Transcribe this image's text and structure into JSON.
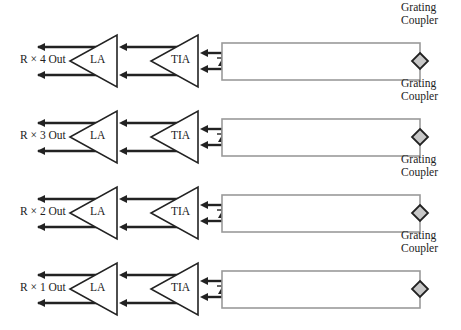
{
  "diagram": {
    "type": "optical receiver array block diagram",
    "colors": {
      "line": "#222222",
      "waveguide": "#9a9a9a",
      "coupler_fill": "#c8c8c8",
      "background": "#ffffff"
    },
    "rows": [
      {
        "output_label": "R × 4 Out",
        "la_label": "LA",
        "tia_label": "TIA",
        "coupler_label_line1": "Grating",
        "coupler_label_line2": "Coupler"
      },
      {
        "output_label": "R × 3 Out",
        "la_label": "LA",
        "tia_label": "TIA",
        "coupler_label_line1": "Grating",
        "coupler_label_line2": "Coupler"
      },
      {
        "output_label": "R × 2 Out",
        "la_label": "LA",
        "tia_label": "TIA",
        "coupler_label_line1": "Grating",
        "coupler_label_line2": "Coupler"
      },
      {
        "output_label": "R × 1 Out",
        "la_label": "LA",
        "tia_label": "TIA",
        "coupler_label_line1": "Grating",
        "coupler_label_line2": "Coupler"
      }
    ],
    "components": [
      "Grating Coupler",
      "Waveguide",
      "Photodiode",
      "TIA",
      "LA",
      "Differential Output"
    ]
  }
}
